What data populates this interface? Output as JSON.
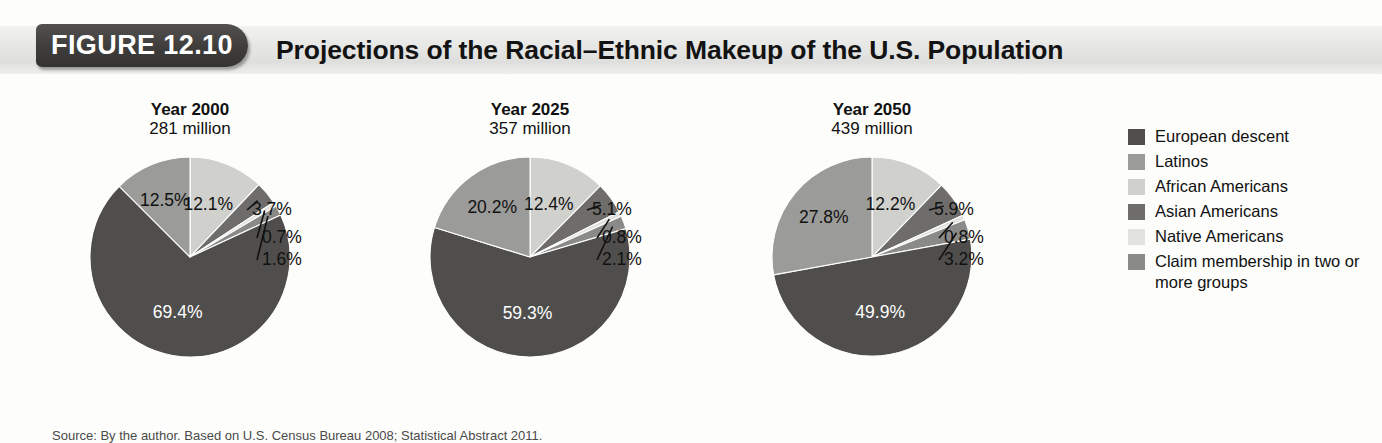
{
  "header": {
    "badge_label": "FIGURE 12.10",
    "title": "Projections of the Racial–Ethnic Makeup of the U.S. Population"
  },
  "source": {
    "text": "Source: By the author. Based on U.S. Census Bureau 2008; Statistical Abstract 2011."
  },
  "legend": {
    "items": [
      {
        "label": "European descent",
        "color": "#4f4e4c"
      },
      {
        "label": "Latinos",
        "color": "#9b9b99"
      },
      {
        "label": "African Americans",
        "color": "#d0d0cd"
      },
      {
        "label": "Asian Americans",
        "color": "#6e6d6b"
      },
      {
        "label": "Native Americans",
        "color": "#e2e2df"
      },
      {
        "label": "Claim membership in two or more groups",
        "color": "#8a8a88"
      }
    ]
  },
  "chart_data": {
    "type": "pie",
    "title": "Projections of the Racial–Ethnic Makeup of the U.S. Population",
    "categories": [
      "African Americans",
      "Asian Americans",
      "Native Americans",
      "Claim membership in two or more groups",
      "European descent",
      "Latinos"
    ],
    "colors": [
      "#d0d0cd",
      "#6e6d6b",
      "#e2e2df",
      "#8a8a88",
      "#4f4e4c",
      "#9b9b99"
    ],
    "legend_position": "right",
    "grid": false,
    "charts": [
      {
        "year_label": "Year 2000",
        "population_label": "281 million",
        "values": [
          12.1,
          3.7,
          0.7,
          1.6,
          69.4,
          12.5
        ],
        "labels": [
          "12.1%",
          "3.7%",
          "0.7%",
          "1.6%",
          "69.4%",
          "12.5%"
        ]
      },
      {
        "year_label": "Year 2025",
        "population_label": "357 million",
        "values": [
          12.4,
          5.1,
          0.8,
          2.1,
          59.3,
          20.2
        ],
        "labels": [
          "12.4%",
          "5.1%",
          "0.8%",
          "2.1%",
          "59.3%",
          "20.2%"
        ]
      },
      {
        "year_label": "Year 2050",
        "population_label": "439 million",
        "values": [
          12.2,
          5.9,
          0.8,
          3.2,
          49.9,
          27.8
        ],
        "labels": [
          "12.2%",
          "5.9%",
          "0.8%",
          "3.2%",
          "49.9%",
          "27.8%"
        ]
      }
    ]
  }
}
